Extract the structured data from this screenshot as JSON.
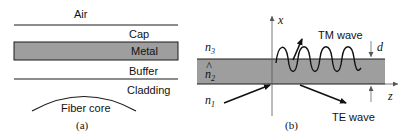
{
  "panel_a": {
    "layers": {
      "air": "Air",
      "cap": "Cap",
      "metal": "Metal",
      "buffer": "Buffer",
      "cladding": "Cladding",
      "core": "Fiber core"
    },
    "caption": "(a)"
  },
  "panel_b": {
    "axis_x": "x",
    "axis_z": "z",
    "n3": "n",
    "n3_sub": "3",
    "n2": "n",
    "n2_hat": "^",
    "n2_sub": "2",
    "n1": "n",
    "n1_sub": "1",
    "tm_label": "TM wave",
    "te_label": "TE wave",
    "thickness_label": "d",
    "caption": "(b)"
  },
  "colors": {
    "metal_fill": "#9e9e9e",
    "line": "#1a1a1a"
  }
}
